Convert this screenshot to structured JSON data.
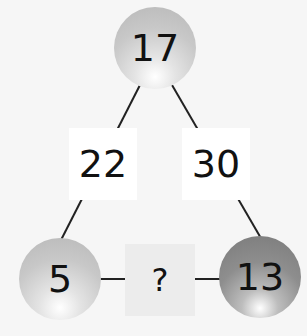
{
  "diagram": {
    "top_node": {
      "value": "17"
    },
    "left_node": {
      "value": "5"
    },
    "right_node": {
      "value": "13"
    },
    "left_edge_label": {
      "value": "22"
    },
    "right_edge_label": {
      "value": "30"
    },
    "bottom_edge_label": {
      "value": "?"
    }
  }
}
